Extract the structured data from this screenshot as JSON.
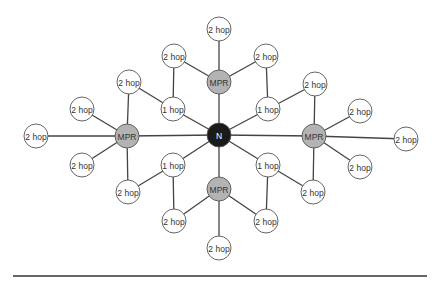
{
  "diagram": {
    "type": "network-topology",
    "center": {
      "id": "N",
      "label": "N",
      "x": 219,
      "y": 135,
      "r": 12,
      "fill": "#1a1a1a",
      "text_color": "#ffffff"
    },
    "node_styles": {
      "mpr": {
        "r": 12,
        "fill": "#b3b3b3",
        "text_color": "#333333"
      },
      "one_hop": {
        "r": 12,
        "fill": "#ffffff",
        "text_color": "#333333"
      },
      "two_hop": {
        "r": 12,
        "fill": "#ffffff",
        "text_color": "#333333"
      }
    },
    "nodes": [
      {
        "id": "mpr_t",
        "kind": "mpr",
        "label": "MPR",
        "x": 219,
        "y": 82
      },
      {
        "id": "mpr_l",
        "kind": "mpr",
        "label": "MPR",
        "x": 127,
        "y": 136
      },
      {
        "id": "mpr_r",
        "kind": "mpr",
        "label": "MPR",
        "x": 314,
        "y": 136
      },
      {
        "id": "mpr_b",
        "kind": "mpr",
        "label": "MPR",
        "x": 219,
        "y": 189
      },
      {
        "id": "h1_tl",
        "kind": "one_hop",
        "label": "1 hop",
        "x": 173,
        "y": 109
      },
      {
        "id": "h1_tr",
        "kind": "one_hop",
        "label": "1 hop",
        "x": 268,
        "y": 109
      },
      {
        "id": "h1_bl",
        "kind": "one_hop",
        "label": "1 hop",
        "x": 173,
        "y": 165
      },
      {
        "id": "h1_br",
        "kind": "one_hop",
        "label": "1 hop",
        "x": 268,
        "y": 165
      },
      {
        "id": "h2_t_top",
        "kind": "two_hop",
        "label": "2 hop",
        "x": 219,
        "y": 29
      },
      {
        "id": "h2_t_left",
        "kind": "two_hop",
        "label": "2 hop",
        "x": 174,
        "y": 56
      },
      {
        "id": "h2_t_right",
        "kind": "two_hop",
        "label": "2 hop",
        "x": 266,
        "y": 56
      },
      {
        "id": "h2_tl",
        "kind": "two_hop",
        "label": "2 hop",
        "x": 129,
        "y": 82
      },
      {
        "id": "h2_tr",
        "kind": "two_hop",
        "label": "2 hop",
        "x": 315,
        "y": 84
      },
      {
        "id": "h2_l_up",
        "kind": "two_hop",
        "label": "2 hop",
        "x": 82,
        "y": 109
      },
      {
        "id": "h2_l_far",
        "kind": "two_hop",
        "label": "2 hop",
        "x": 36,
        "y": 136
      },
      {
        "id": "h2_l_down",
        "kind": "two_hop",
        "label": "2 hop",
        "x": 82,
        "y": 165
      },
      {
        "id": "h2_r_up",
        "kind": "two_hop",
        "label": "2 hop",
        "x": 360,
        "y": 111
      },
      {
        "id": "h2_r_far",
        "kind": "two_hop",
        "label": "2 hop",
        "x": 406,
        "y": 139
      },
      {
        "id": "h2_r_down",
        "kind": "two_hop",
        "label": "2 hop",
        "x": 360,
        "y": 167
      },
      {
        "id": "h2_bl",
        "kind": "two_hop",
        "label": "2 hop",
        "x": 128,
        "y": 192
      },
      {
        "id": "h2_br",
        "kind": "two_hop",
        "label": "2 hop",
        "x": 313,
        "y": 192
      },
      {
        "id": "h2_b_left",
        "kind": "two_hop",
        "label": "2 hop",
        "x": 174,
        "y": 221
      },
      {
        "id": "h2_b_right",
        "kind": "two_hop",
        "label": "2 hop",
        "x": 266,
        "y": 221
      },
      {
        "id": "h2_b_bottom",
        "kind": "two_hop",
        "label": "2 hop",
        "x": 219,
        "y": 248
      }
    ],
    "edges": [
      [
        "N",
        "mpr_t"
      ],
      [
        "N",
        "mpr_l"
      ],
      [
        "N",
        "mpr_r"
      ],
      [
        "N",
        "mpr_b"
      ],
      [
        "N",
        "h1_tl"
      ],
      [
        "N",
        "h1_tr"
      ],
      [
        "N",
        "h1_bl"
      ],
      [
        "N",
        "h1_br"
      ],
      [
        "mpr_t",
        "h2_t_top"
      ],
      [
        "mpr_t",
        "h2_t_left"
      ],
      [
        "mpr_t",
        "h2_t_right"
      ],
      [
        "mpr_l",
        "h2_l_up"
      ],
      [
        "mpr_l",
        "h2_l_far"
      ],
      [
        "mpr_l",
        "h2_l_down"
      ],
      [
        "mpr_l",
        "h2_tl"
      ],
      [
        "mpr_l",
        "h2_bl"
      ],
      [
        "mpr_r",
        "h2_r_up"
      ],
      [
        "mpr_r",
        "h2_r_far"
      ],
      [
        "mpr_r",
        "h2_r_down"
      ],
      [
        "mpr_r",
        "h2_tr"
      ],
      [
        "mpr_r",
        "h2_br"
      ],
      [
        "mpr_b",
        "h2_b_left"
      ],
      [
        "mpr_b",
        "h2_b_right"
      ],
      [
        "mpr_b",
        "h2_b_bottom"
      ],
      [
        "h1_tl",
        "h2_t_left"
      ],
      [
        "h1_tl",
        "h2_tl"
      ],
      [
        "h1_tr",
        "h2_t_right"
      ],
      [
        "h1_tr",
        "h2_tr"
      ],
      [
        "h1_bl",
        "h2_bl"
      ],
      [
        "h1_bl",
        "h2_b_left"
      ],
      [
        "h1_br",
        "h2_br"
      ],
      [
        "h1_br",
        "h2_b_right"
      ]
    ],
    "edge_color": "#444444",
    "node_stroke": "#555555",
    "divider": {
      "x1": 13,
      "x2": 427,
      "y": 276,
      "color": "#333333"
    }
  }
}
